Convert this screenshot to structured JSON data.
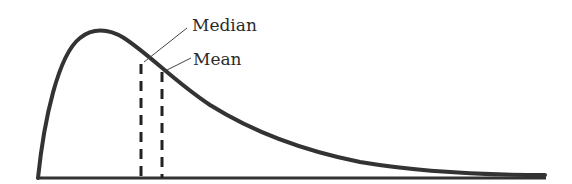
{
  "diagram": {
    "title": "",
    "type": "right-skewed distribution",
    "colors": {
      "background": "#ffffff",
      "stroke": "#333333",
      "text": "#2b2b2b"
    },
    "labels": {
      "median": "Median",
      "mean": "Mean"
    },
    "markers": [
      {
        "name": "median",
        "x": 141,
        "style": "dashed"
      },
      {
        "name": "mean",
        "x": 162,
        "style": "dashed"
      }
    ]
  }
}
